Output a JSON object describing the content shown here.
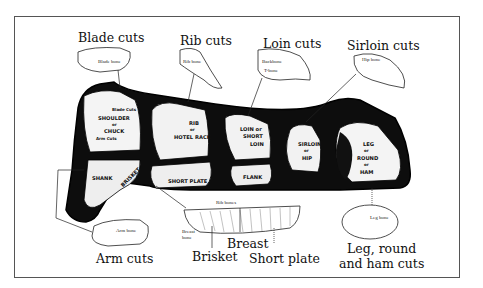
{
  "diagram": {
    "section_titles": {
      "blade": "Blade cuts",
      "rib": "Rib cuts",
      "loin": "Loin cuts",
      "sirloin": "Sirloin cuts",
      "arm": "Arm cuts",
      "brisket": "Brisket",
      "breast": "Breast",
      "short_plate": "Short plate",
      "leg_line1": "Leg, round",
      "leg_line2": "and ham cuts"
    },
    "bone_labels": {
      "blade_bone": "Blade bone",
      "rib_bone": "Rib bone",
      "backbone": "Backbone",
      "t_bone": "T-bone",
      "hip_bone": "Hip bone",
      "arm_bone": "Arm bone",
      "rib_bones": "Rib bones",
      "breast_bone_1": "Breast",
      "breast_bone_2": "bone",
      "leg_bone": "Leg bone"
    },
    "carcass_cuts": {
      "blade_cuts": "Blade Cuts",
      "shoulder_1": "SHOULDER",
      "shoulder_or": "or",
      "shoulder_2": "CHUCK",
      "arm_cuts": "Arm Cuts",
      "rib_1": "RIB",
      "rib_or": "or",
      "rib_2": "HOTEL RACK",
      "loin_1": "LOIN or",
      "loin_2": "SHORT",
      "loin_3": "LOIN",
      "sirloin_1": "SIRLOIN",
      "sirloin_or": "or",
      "sirloin_2": "HIP",
      "leg_1": "LEG",
      "leg_or1": "or",
      "leg_2": "ROUND",
      "leg_or2": "or",
      "leg_3": "HAM",
      "shank": "SHANK",
      "brisket": "BRISKET",
      "short_plate": "SHORT PLATE",
      "flank": "FLANK"
    }
  }
}
